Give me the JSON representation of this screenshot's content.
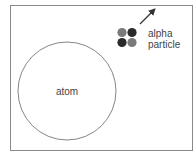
{
  "diagram": {
    "atom": {
      "label": "atom",
      "outline_color": "#666666"
    },
    "alpha_particle": {
      "label_line1": "alpha",
      "label_line2": "particle",
      "balls": [
        {
          "position": "top-left",
          "color": "#7a7a7a"
        },
        {
          "position": "top-right",
          "color": "#2a2a2a"
        },
        {
          "position": "bottom-left",
          "color": "#2a2a2a"
        },
        {
          "position": "bottom-right",
          "color": "#7a7a7a"
        }
      ],
      "arrow_direction": "up-right"
    },
    "frame_color": "#888888"
  }
}
